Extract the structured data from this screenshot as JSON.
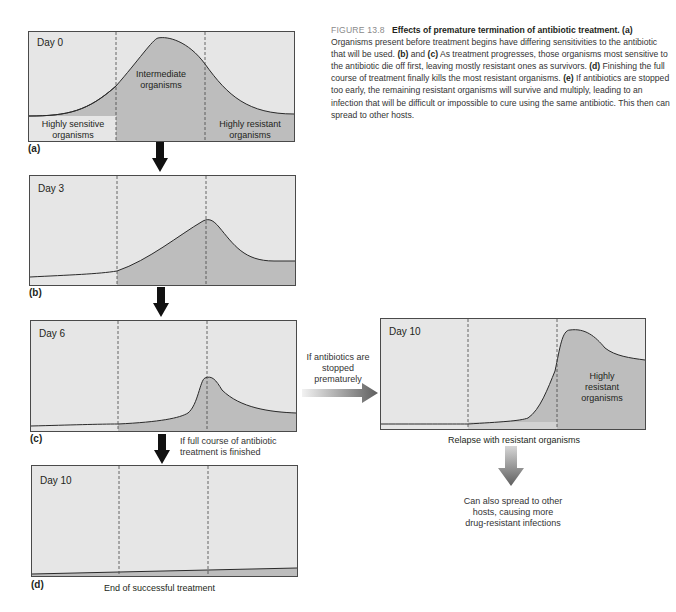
{
  "caption": {
    "figure_number": "FIGURE 13.8",
    "title": "Effects of premature termination of antibiotic treatment.",
    "segments": [
      {
        "tag": "(a)",
        "text": " Organisms present before treatment begins have differing sensitivities to the antibiotic that will be used. "
      },
      {
        "tag": "(b)",
        "text": " and "
      },
      {
        "tag": "(c)",
        "text": " As treatment progresses, those organisms most sensitive to the antibiotic die off first, leaving mostly resistant ones as survivors. "
      },
      {
        "tag": "(d)",
        "text": " Finishing the full course of treatment finally kills the most resistant organisms. "
      },
      {
        "tag": "(e)",
        "text": " If antibiotics are stopped too early, the remaining resistant organisms will survive and multiply, leading to an infection that will be difficult or impossible to cure using the same antibiotic. This then can spread to other hosts."
      }
    ]
  },
  "panels": {
    "a": {
      "label": "(a)",
      "day": "Day 0",
      "left_region": "Highly sensitive organisms",
      "middle_region": "Intermediate organisms",
      "right_region": "Highly resistant organisms"
    },
    "b": {
      "label": "(b)",
      "day": "Day 3"
    },
    "c": {
      "label": "(c)",
      "day": "Day 6"
    },
    "d": {
      "label": "(d)",
      "day": "Day 10",
      "footer": "End of successful treatment"
    },
    "e": {
      "day": "Day 10",
      "region": "Highly resistant organisms",
      "footer": "Relapse with resistant organisms"
    }
  },
  "notes": {
    "full_course": "If full course of antibiotic treatment is finished",
    "stopped_early": "If antibiotics are stopped prematurely",
    "spread": "Can also spread to other hosts, causing more drug-resistant infections"
  },
  "colors": {
    "background_fill": "#e6e6e6",
    "population_fill": "#bdbdbd",
    "border": "#4a4a4a",
    "curve": "#2a2a2a",
    "arrow_black": "#111111",
    "arrow_gray": "#6e6e6e"
  }
}
